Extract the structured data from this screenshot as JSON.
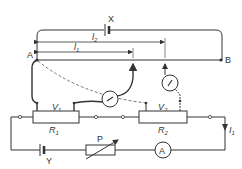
{
  "diagram": {
    "type": "potentiometer circuit",
    "labels": {
      "battery_top": "X",
      "battery_bottom": "Y",
      "point_a": "A",
      "point_b": "B",
      "length_1": "l",
      "length_1_sub": "1",
      "length_2": "l",
      "length_2_sub": "2",
      "resistor_1": "R",
      "resistor_1_sub": "1",
      "resistor_2": "R",
      "resistor_2_sub": "2",
      "voltage_1": "V",
      "voltage_1_sub": "1",
      "voltage_2": "V",
      "voltage_2_sub": "2",
      "rheostat": "P",
      "ammeter": "A",
      "current": "I",
      "current_sub": "1"
    },
    "colors": {
      "line": "#333333",
      "background": "#ffffff"
    }
  }
}
